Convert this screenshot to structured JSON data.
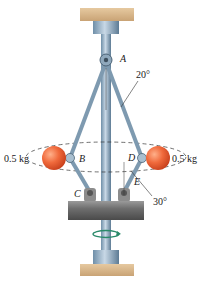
{
  "diagram": {
    "type": "mechanism",
    "points": {
      "A": "A",
      "B": "B",
      "C": "C",
      "D": "D",
      "E": "E"
    },
    "angles": {
      "top": "20°",
      "bottom": "30°"
    },
    "masses": {
      "left": "0.5 kg",
      "right": "0.5 kg"
    }
  }
}
